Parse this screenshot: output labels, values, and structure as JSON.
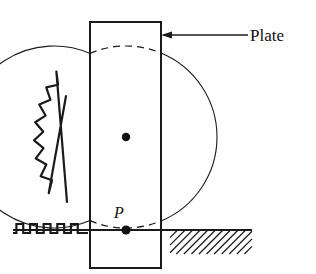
{
  "figure": {
    "canvas": {
      "width": 316,
      "height": 274,
      "background": "#ffffff"
    },
    "stroke_color": "#1a1a1a",
    "labels": {
      "plate": "Plate",
      "contact_point": "P"
    },
    "plate": {
      "name": "Plate",
      "x": 90,
      "y": 22,
      "width": 71,
      "height": 246,
      "stroke_width": 2
    },
    "disk": {
      "name": "Disk",
      "center_x": 126,
      "center_y": 137,
      "radius": 91,
      "stroke_width": 1.1,
      "center_dot_radius": 4.2
    },
    "ground": {
      "y": 230,
      "x_start": 13,
      "x_end": 252,
      "stroke_width": 2
    },
    "hatching": {
      "x_start": 170,
      "x_end": 252,
      "y_top": 230,
      "y_bottom": 254,
      "line_count": 13,
      "stroke_width": 1.2
    },
    "ground_spring": {
      "name": "square-wave-spring",
      "x_start": 13,
      "x_end": 88,
      "baseline_y": 233,
      "amplitude": 9,
      "periods": 5,
      "stroke_width": 2.2
    },
    "arc_spring": {
      "name": "zigzag-coil-spring",
      "top_x": 60,
      "top_y": 104,
      "bottom_x": 57,
      "bottom_y": 196,
      "zigzags": 7,
      "stroke_width": 2.2
    },
    "arrow": {
      "name": "plate-callout-arrow",
      "tip_x": 161,
      "tip_y": 35,
      "tail_x": 248,
      "tail_y": 35,
      "head_length": 11,
      "head_width": 7,
      "stroke_width": 1.6
    },
    "plate_label_position": {
      "x": 250,
      "y": 41
    },
    "contact_point": {
      "dot_x": 126,
      "dot_y": 230,
      "dot_radius": 4.6,
      "label_x": 119,
      "label_y": 218
    },
    "dashed_arcs": {
      "dash_pattern": "7,5",
      "stroke_width": 1.2,
      "top_visible": true,
      "bottom_visible": true
    }
  }
}
